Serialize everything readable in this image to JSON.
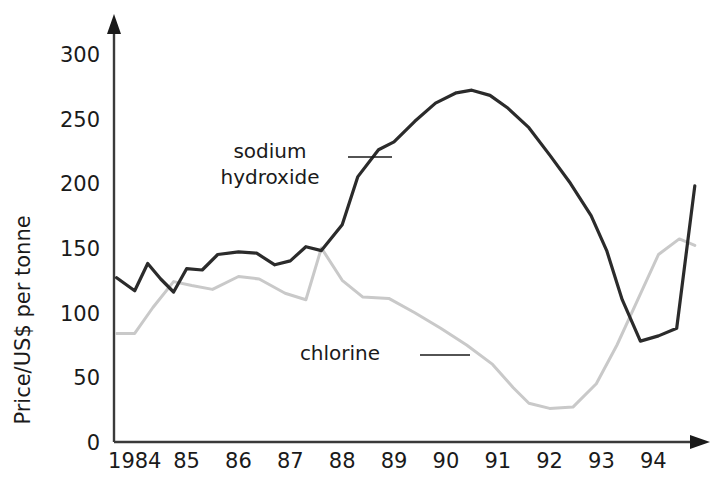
{
  "chart_data": {
    "type": "line",
    "title": "",
    "xlabel": "",
    "ylabel": "Price/US$ per tonne",
    "ylim": [
      0,
      315
    ],
    "yticks": [
      0,
      50,
      100,
      150,
      200,
      250,
      300
    ],
    "ytick_labels": [
      "0",
      "50",
      "100",
      "150",
      "200",
      "250",
      "300"
    ],
    "xlim": [
      1983.6,
      1994.9
    ],
    "xticks": [
      1984,
      1985,
      1986,
      1987,
      1988,
      1989,
      1990,
      1991,
      1992,
      1993,
      1994
    ],
    "xtick_labels": [
      "1984",
      "85",
      "86",
      "87",
      "88",
      "89",
      "90",
      "91",
      "92",
      "93",
      "94"
    ],
    "grid": false,
    "legend": "inline-annotations",
    "series": [
      {
        "name": "sodium hydroxide",
        "color": "#2b2b2b",
        "linewidth": 3.2,
        "x": [
          1983.65,
          1984.0,
          1984.25,
          1984.5,
          1984.75,
          1985.0,
          1985.3,
          1985.6,
          1986.0,
          1986.35,
          1986.7,
          1987.0,
          1987.3,
          1987.6,
          1988.0,
          1988.3,
          1988.7,
          1989.0,
          1989.4,
          1989.8,
          1990.2,
          1990.5,
          1990.85,
          1991.2,
          1991.6,
          1992.0,
          1992.4,
          1992.8,
          1993.1,
          1993.4,
          1993.75,
          1994.1,
          1994.45,
          1994.8
        ],
        "y": [
          127,
          117,
          138,
          126,
          116,
          134,
          133,
          145,
          147,
          146,
          137,
          140,
          151,
          148,
          168,
          205,
          226,
          232,
          248,
          262,
          270,
          272,
          268,
          258,
          243,
          222,
          200,
          175,
          148,
          110,
          78,
          82,
          88,
          198
        ]
      },
      {
        "name": "chlorine",
        "color": "#c9c9c9",
        "linewidth": 3.0,
        "x": [
          1983.65,
          1984.0,
          1984.35,
          1984.75,
          1985.1,
          1985.5,
          1986.0,
          1986.4,
          1986.9,
          1987.3,
          1987.6,
          1988.0,
          1988.4,
          1988.9,
          1989.4,
          1989.9,
          1990.4,
          1990.9,
          1991.3,
          1991.6,
          1992.0,
          1992.45,
          1992.9,
          1993.3,
          1993.7,
          1994.1,
          1994.5,
          1994.8
        ],
        "y": [
          84,
          84,
          104,
          124,
          121,
          118,
          128,
          126,
          115,
          110,
          150,
          125,
          112,
          111,
          100,
          88,
          75,
          60,
          42,
          30,
          26,
          27,
          45,
          75,
          110,
          145,
          157,
          152
        ]
      }
    ],
    "annotations": [
      {
        "name": "sodium-hydroxide-label",
        "lines": [
          "sodium",
          "hydroxide"
        ],
        "text_x": 270,
        "text_y": 158,
        "leader": {
          "x1": 348,
          "y1": 157,
          "x2": 392,
          "y2": 157
        }
      },
      {
        "name": "chlorine-label",
        "lines": [
          "chlorine"
        ],
        "text_x": 340,
        "text_y": 360,
        "leader": {
          "x1": 420,
          "y1": 355,
          "x2": 470,
          "y2": 355
        }
      }
    ]
  },
  "axes": {
    "y_axis_title": "Price/US$ per tonne",
    "axis_color": "#3a3a3a",
    "plot_left": 114,
    "plot_right": 700,
    "plot_top": 20,
    "plot_bottom": 442
  }
}
